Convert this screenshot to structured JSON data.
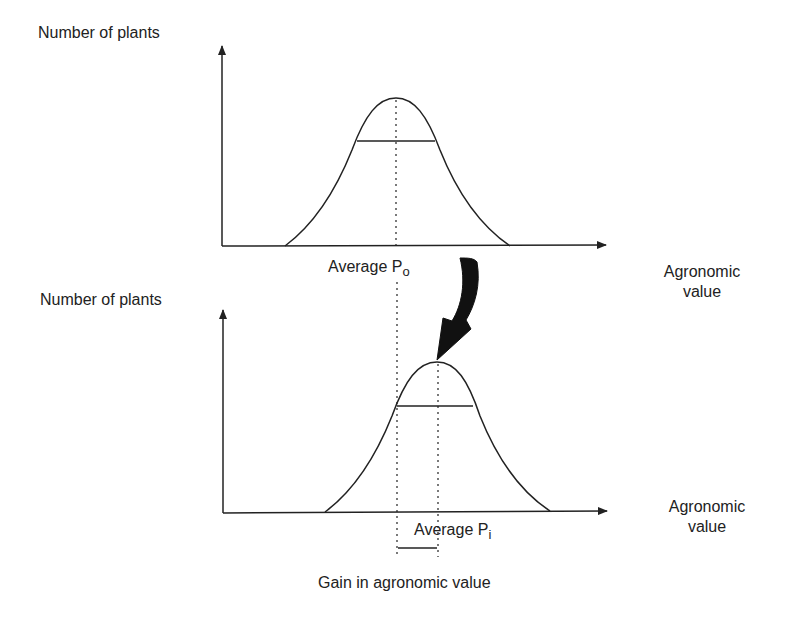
{
  "figure": {
    "top_panel": {
      "y_label": "Number of plants",
      "x_label_line1": "Agronomic",
      "x_label_line2": "value",
      "average_label": "Average P",
      "average_sub": "o"
    },
    "bottom_panel": {
      "y_label": "Number of plants",
      "x_label_line1": "Agronomic",
      "x_label_line2": "value",
      "average_label": "Average P",
      "average_sub": "i"
    },
    "gain_label": "Gain in agronomic value",
    "colors": {
      "ink": "#222222",
      "background": "#ffffff"
    }
  }
}
